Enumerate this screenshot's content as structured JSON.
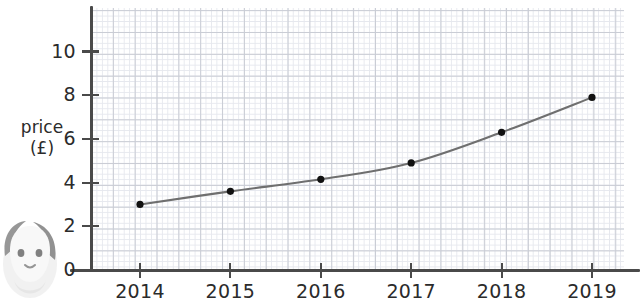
{
  "chart_data": {
    "type": "line",
    "title": "",
    "subtitle": "",
    "xlabel": "",
    "ylabel": "price (£)",
    "ylabel_lines": [
      "price",
      "(£)"
    ],
    "categories": [
      "2014",
      "2015",
      "2016",
      "2017",
      "2018",
      "2019"
    ],
    "x": [
      2014,
      2015,
      2016,
      2017,
      2018,
      2019
    ],
    "values": [
      3.0,
      3.6,
      4.15,
      4.9,
      6.3,
      7.9
    ],
    "series": [
      {
        "name": "price",
        "values": [
          3.0,
          3.6,
          4.15,
          4.9,
          6.3,
          7.9
        ]
      }
    ],
    "ylim": [
      0,
      11.8
    ],
    "xlim": [
      2013.55,
      2019.6
    ],
    "ytick_labels": [
      "0",
      "2",
      "4",
      "6",
      "8",
      "10"
    ],
    "ytick_values": [
      0,
      2,
      4,
      6,
      8,
      10
    ],
    "xtick_labels": [
      "2014",
      "2015",
      "2016",
      "2017",
      "2018",
      "2019"
    ],
    "grid": true,
    "grid_style": "graph-paper-minor-and-major",
    "legend": false,
    "legend_position": "none",
    "marker": "filled-circle",
    "line_color": "#6f6f6f",
    "marker_color": "#111111",
    "axis_color": "#4a4a4a",
    "grid_major_color": "#c9ccd4",
    "grid_minor_color": "#e6e8ee",
    "background_color": "#ffffff",
    "annotations": []
  },
  "decorations": {
    "mascot_label": "cartoon-character-watermark"
  }
}
